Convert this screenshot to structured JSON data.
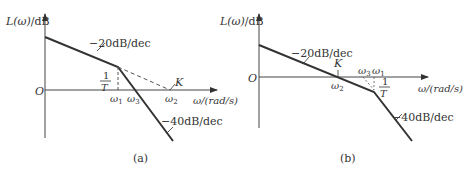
{
  "panels": [
    {
      "id": "a",
      "caption": "(a)",
      "y_axis_label_fn": "L(ω)",
      "y_axis_label_unit": "/dB",
      "x_axis_label": "ω/(rad/s)",
      "origin_label": "O",
      "slope1_label": "−20dB/dec",
      "slope2_label": "−40dB/dec",
      "point_K": "K",
      "frac_num": "1",
      "frac_den": "T",
      "omega1": "ω",
      "omega1_sub": "1",
      "omega2": "ω",
      "omega2_sub": "2",
      "omega3": "ω",
      "omega3_sub": "3"
    },
    {
      "id": "b",
      "caption": "(b)",
      "y_axis_label_fn": "L(ω)",
      "y_axis_label_unit": "/dB",
      "x_axis_label": "ω/(rad/s)",
      "origin_label": "O",
      "slope1_label": "−20dB/dec",
      "slope2_label": "−40dB/dec",
      "point_K": "K",
      "frac_num": "1",
      "frac_den": "T",
      "omega1": "ω",
      "omega1_sub": "1",
      "omega2": "ω",
      "omega2_sub": "2",
      "omega3": "ω",
      "omega3_sub": "3"
    }
  ],
  "colors": {
    "line": "#333333",
    "axis": "#444444",
    "dash": "#555555"
  }
}
